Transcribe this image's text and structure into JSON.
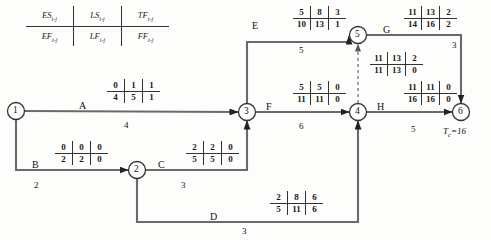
{
  "diagram": {
    "type": "cpm-network",
    "project_completion_label": "T",
    "project_completion_sub": "c",
    "project_completion_value": "=16"
  },
  "legend": {
    "top": [
      {
        "sym": "ES",
        "sub": "i-j"
      },
      {
        "sym": "LS",
        "sub": "i-j"
      },
      {
        "sym": "TF",
        "sub": "i-j"
      }
    ],
    "bottom": [
      {
        "sym": "EF",
        "sub": "i-j"
      },
      {
        "sym": "LF",
        "sub": "i-j"
      },
      {
        "sym": "FF",
        "sub": "i-j"
      }
    ]
  },
  "nodes": [
    {
      "id": "1",
      "label": "1",
      "cx": 16,
      "cy": 111
    },
    {
      "id": "2",
      "label": "2",
      "cx": 137,
      "cy": 170
    },
    {
      "id": "3",
      "label": "3",
      "cx": 247,
      "cy": 112
    },
    {
      "id": "4",
      "label": "4",
      "cx": 358,
      "cy": 112
    },
    {
      "id": "5",
      "label": "5",
      "cx": 358,
      "cy": 35
    },
    {
      "id": "6",
      "label": "6",
      "cx": 461,
      "cy": 112
    }
  ],
  "activities": [
    {
      "key": "A",
      "name": "A",
      "from": "1",
      "to": "3",
      "duration": "4",
      "es": "0",
      "ls": "1",
      "tf": "1",
      "ef": "4",
      "lf": "5",
      "ff": "1",
      "critical": false
    },
    {
      "key": "B",
      "name": "B",
      "from": "1",
      "to": "2",
      "duration": "2",
      "es": "0",
      "ls": "0",
      "tf": "0",
      "ef": "2",
      "lf": "2",
      "ff": "0",
      "critical": true
    },
    {
      "key": "C",
      "name": "C",
      "from": "2",
      "to": "3",
      "duration": "3",
      "es": "2",
      "ls": "2",
      "tf": "0",
      "ef": "5",
      "lf": "5",
      "ff": "0",
      "critical": true
    },
    {
      "key": "D",
      "name": "D",
      "from": "2",
      "to": "4",
      "duration": "3",
      "es": "2",
      "ls": "8",
      "tf": "6",
      "ef": "5",
      "lf": "11",
      "ff": "6",
      "critical": false
    },
    {
      "key": "E",
      "name": "E",
      "from": "3",
      "to": "5",
      "duration": "5",
      "es": "5",
      "ls": "8",
      "tf": "3",
      "ef": "10",
      "lf": "13",
      "ff": "1",
      "critical": false
    },
    {
      "key": "F",
      "name": "F",
      "from": "3",
      "to": "4",
      "duration": "6",
      "es": "5",
      "ls": "5",
      "tf": "0",
      "ef": "11",
      "lf": "11",
      "ff": "0",
      "critical": true
    },
    {
      "key": "G",
      "name": "G",
      "from": "5",
      "to": "6",
      "duration": "3",
      "es": "11",
      "ls": "13",
      "tf": "2",
      "ef": "14",
      "lf": "16",
      "ff": "2",
      "critical": false
    },
    {
      "key": "H",
      "name": "H",
      "from": "4",
      "to": "6",
      "duration": "5",
      "es": "11",
      "ls": "11",
      "tf": "0",
      "ef": "16",
      "lf": "16",
      "ff": "0",
      "critical": true
    },
    {
      "key": "DUMMY",
      "name": "",
      "from": "4",
      "to": "5",
      "duration": "",
      "es": "11",
      "ls": "13",
      "tf": "2",
      "ef": "11",
      "lf": "13",
      "ff": "0",
      "critical": false
    }
  ],
  "colors": {
    "line": "#555555",
    "text": "#111111",
    "background": "#fdfdfb",
    "node_stroke": "#333333"
  }
}
